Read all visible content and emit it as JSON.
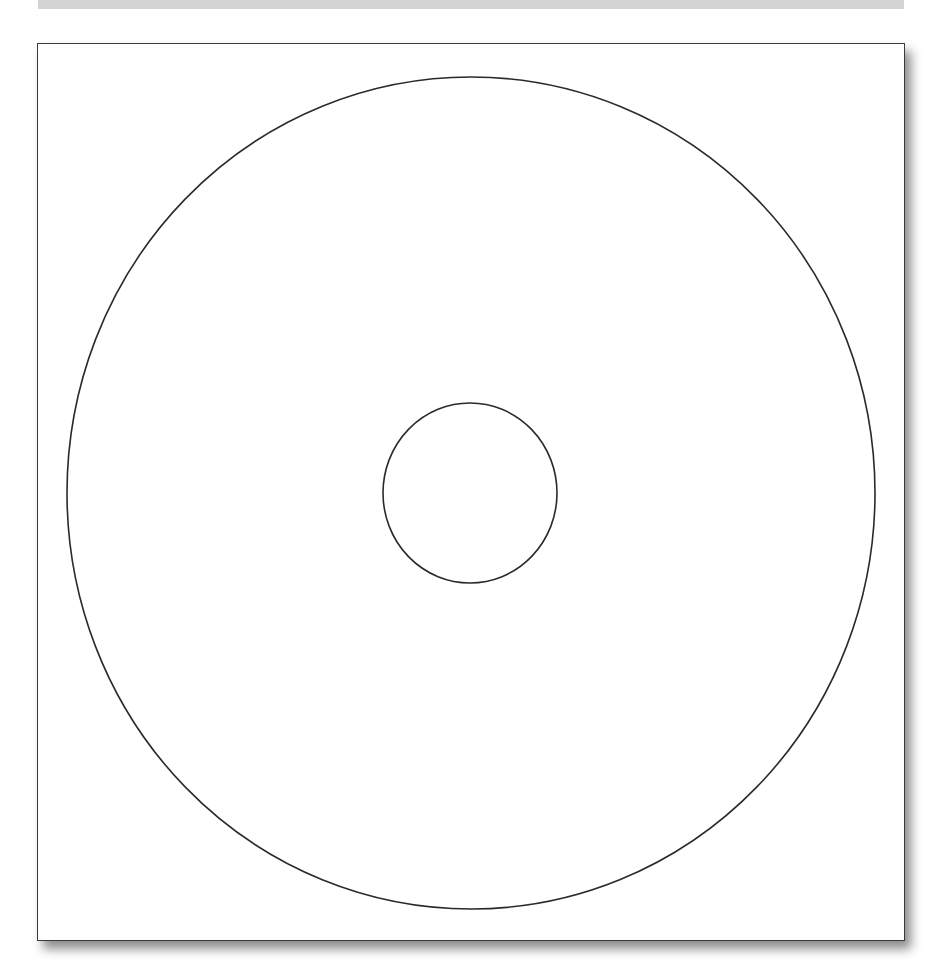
{
  "diagram": {
    "type": "disc-label-template",
    "colors": {
      "stroke": "#2a2a2a",
      "background": "#ffffff",
      "top_bar": "#d4d4d4",
      "frame_border": "#3a3a3a"
    },
    "outer_circle": {
      "cx": 471,
      "cy": 493,
      "rx": 404,
      "ry": 416
    },
    "inner_circle": {
      "cx": 470,
      "cy": 493,
      "rx": 87,
      "ry": 90
    }
  }
}
